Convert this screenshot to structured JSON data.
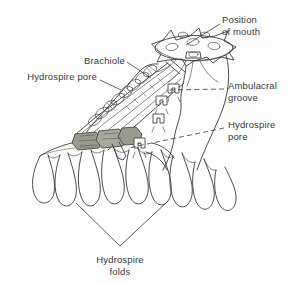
{
  "figure": {
    "kind": "biological-line-diagram",
    "background_color": "#fdfdfd",
    "ink_color": "#3a3a3a",
    "shade_color": "#9a9a8e",
    "accent_color": "#6aa06a",
    "width": 305,
    "height": 285
  },
  "labels": {
    "position_of_mouth": "Position\nof mouth",
    "brachiole": "Brachiole",
    "hydrospire_pore_left": "Hydrospire pore",
    "ambulacral_groove": "Ambulacral\ngroove",
    "hydrospire_pore_right": "Hydrospire\npore",
    "hydrospire_folds": "Hydrospire\nfolds"
  },
  "leaders": {
    "position_of_mouth": {
      "style": "solid",
      "from": [
        220,
        24
      ],
      "to": [
        186,
        45
      ]
    },
    "brachiole": {
      "style": "solid",
      "from": [
        127,
        62
      ],
      "to": [
        151,
        78
      ]
    },
    "hydrospire_pore_left": {
      "style": "solid",
      "from": [
        100,
        80
      ],
      "to": [
        121,
        90
      ]
    },
    "ambulacral_groove": {
      "style": "dashed",
      "from": [
        224,
        89
      ],
      "to": [
        166,
        90
      ]
    },
    "hydrospire_pore_right": {
      "style": "dashed",
      "from": [
        224,
        128
      ],
      "to": [
        128,
        148
      ]
    },
    "hydrospire_folds": {
      "style": "bracket",
      "apex": [
        120,
        246
      ]
    }
  },
  "structures": {
    "oral_disc": {
      "name": "oral disc with position of mouth",
      "pore_count": 5,
      "ray_points": 5
    },
    "brachiole_arm": {
      "name": "brachiole arm with side plates",
      "plate_count": 9
    },
    "hydrospire_pores_row": {
      "name": "arch shaped hydrospire pores",
      "count": 4
    },
    "hydrospire_folds_group": {
      "name": "finger like hydrospire folds",
      "left_lobes": 4,
      "right_lobes": 5
    },
    "shaded_blocks": {
      "name": "cut away shaded hydrospire plates",
      "count": 3
    }
  }
}
